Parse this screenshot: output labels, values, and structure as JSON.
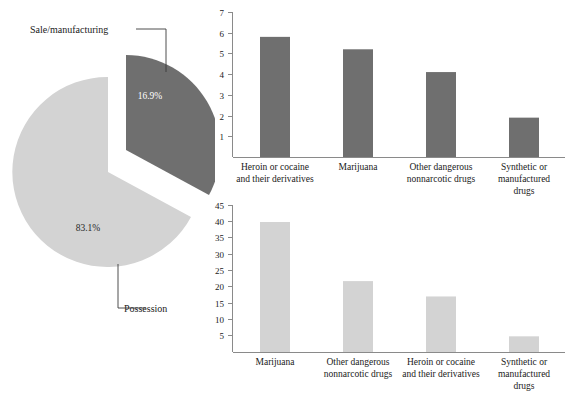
{
  "chart_data": [
    {
      "type": "pie",
      "title": "",
      "slices": [
        {
          "label": "Sale/manufacturing",
          "value": 16.9,
          "value_label": "16.9%",
          "color": "#6f6f6f",
          "exploded": true
        },
        {
          "label": "Possession",
          "value": 83.1,
          "value_label": "83.1%",
          "color": "#d3d3d3",
          "exploded": false
        }
      ],
      "legend_position": "callout-labels",
      "annotations": [
        "Sale/manufacturing",
        "Possession"
      ]
    },
    {
      "type": "bar",
      "title": "",
      "xlabel": "",
      "ylabel": "",
      "ylim": [
        0,
        7
      ],
      "yticks": [
        1,
        2,
        3,
        4,
        5,
        6,
        7
      ],
      "grid": false,
      "bar_color": "#6f6f6f",
      "categories": [
        "Heroin or cocaine and their derivatives",
        "Marijuana",
        "Other dangerous nonnarcotic drugs",
        "Synthetic or manufactured drugs"
      ],
      "category_lines": [
        [
          "Heroin or cocaine",
          "and their derivatives"
        ],
        [
          "Marijuana"
        ],
        [
          "Other dangerous",
          "nonnarcotic drugs"
        ],
        [
          "Synthetic or",
          "manufactured",
          "drugs"
        ]
      ],
      "values": [
        5.8,
        5.2,
        4.1,
        1.9
      ]
    },
    {
      "type": "bar",
      "title": "",
      "xlabel": "",
      "ylabel": "",
      "ylim": [
        0,
        45
      ],
      "yticks": [
        5,
        10,
        15,
        20,
        25,
        30,
        35,
        40,
        45
      ],
      "grid": false,
      "bar_color": "#d3d3d3",
      "categories": [
        "Marijuana",
        "Other dangerous nonnarcotic drugs",
        "Heroin or cocaine and their derivatives",
        "Synthetic or manufactured drugs"
      ],
      "category_lines": [
        [
          "Marijuana"
        ],
        [
          "Other dangerous",
          "nonnarcotic drugs"
        ],
        [
          "Heroin or cocaine",
          "and their derivatives"
        ],
        [
          "Synthetic or",
          "manufactured",
          "drugs"
        ]
      ],
      "values": [
        39.8,
        21.7,
        17.0,
        4.8
      ]
    }
  ],
  "pie": {
    "sale_label": "Sale/manufacturing",
    "sale_pct": "16.9%",
    "possession_label": "Possession",
    "possession_pct": "83.1%"
  },
  "top_chart": {
    "yticks": [
      "7",
      "6",
      "5",
      "4",
      "3",
      "2",
      "1"
    ],
    "cats": [
      {
        "l1": "Heroin or cocaine",
        "l2": "and their derivatives",
        "l3": ""
      },
      {
        "l1": "Marijuana",
        "l2": "",
        "l3": ""
      },
      {
        "l1": "Other dangerous",
        "l2": "nonnarcotic drugs",
        "l3": ""
      },
      {
        "l1": "Synthetic or",
        "l2": "manufactured",
        "l3": "drugs"
      }
    ]
  },
  "bottom_chart": {
    "yticks": [
      "45",
      "40",
      "35",
      "30",
      "25",
      "20",
      "15",
      "10",
      "5"
    ],
    "cats": [
      {
        "l1": "Marijuana",
        "l2": "",
        "l3": ""
      },
      {
        "l1": "Other dangerous",
        "l2": "nonnarcotic drugs",
        "l3": ""
      },
      {
        "l1": "Heroin or cocaine",
        "l2": "and their derivatives",
        "l3": ""
      },
      {
        "l1": "Synthetic or",
        "l2": "manufactured",
        "l3": "drugs"
      }
    ]
  },
  "colors": {
    "dark_gray": "#6f6f6f",
    "light_gray": "#d3d3d3",
    "axis": "#8a8a8a",
    "text": "#1a1a1a",
    "background": "#ffffff"
  }
}
